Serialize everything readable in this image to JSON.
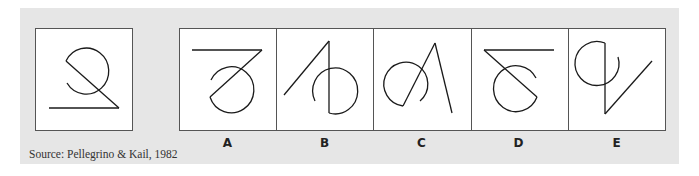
{
  "figure": {
    "reference_label": "",
    "options": [
      {
        "label": "A"
      },
      {
        "label": "B"
      },
      {
        "label": "C"
      },
      {
        "label": "D"
      },
      {
        "label": "E"
      }
    ],
    "source": "Source: Pellegrino & Kail, 1982"
  },
  "colors": {
    "panel_background": "#e6e6e6",
    "box_background": "#ffffff",
    "border": "#555555",
    "stroke": "#1a1a1a"
  }
}
